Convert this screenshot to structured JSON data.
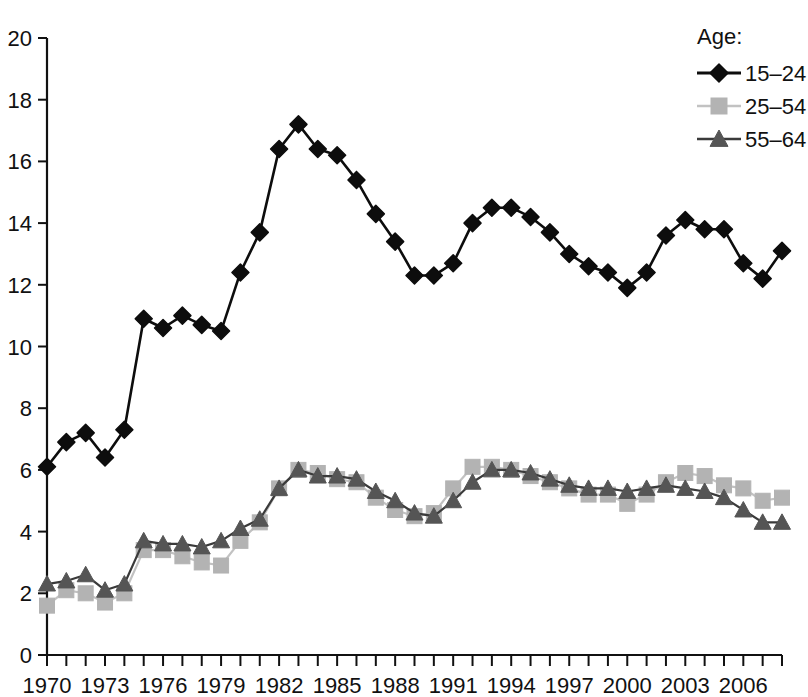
{
  "chart_data": {
    "type": "line",
    "title": "",
    "xlabel": "",
    "ylabel": "",
    "xlim": [
      1970,
      2008
    ],
    "ylim": [
      0,
      20
    ],
    "ytick_step": 2,
    "grid": false,
    "legend_position": "top-right",
    "legend_title": "Age:",
    "yticks": [
      "0",
      "2",
      "4",
      "6",
      "8",
      "10",
      "12",
      "14",
      "16",
      "18",
      "20"
    ],
    "x": [
      1970,
      1971,
      1972,
      1973,
      1974,
      1975,
      1976,
      1977,
      1978,
      1979,
      1980,
      1981,
      1982,
      1983,
      1984,
      1985,
      1986,
      1987,
      1988,
      1989,
      1990,
      1991,
      1992,
      1993,
      1994,
      1995,
      1996,
      1997,
      1998,
      1999,
      2000,
      2001,
      2002,
      2003,
      2004,
      2005,
      2006,
      2007,
      2008
    ],
    "xticklabels": [
      "1970",
      "1973",
      "1976",
      "1979",
      "1982",
      "1985",
      "1988",
      "1991",
      "1994",
      "1997",
      "2000",
      "2003",
      "2006"
    ],
    "xticklabel_years": [
      1970,
      1973,
      1976,
      1979,
      1982,
      1985,
      1988,
      1991,
      1994,
      1997,
      2000,
      2003,
      2006
    ],
    "series": [
      {
        "name": "15–24",
        "marker": "diamond",
        "color": "#0d0d0d",
        "line_color": "#0d0d0d",
        "values": [
          6.1,
          6.9,
          7.2,
          6.4,
          7.3,
          10.9,
          10.6,
          11.0,
          10.7,
          10.5,
          12.4,
          13.7,
          16.4,
          17.2,
          16.4,
          16.2,
          15.4,
          14.3,
          13.4,
          12.3,
          12.3,
          12.7,
          14.0,
          14.5,
          14.5,
          14.2,
          13.7,
          13.0,
          12.6,
          12.4,
          11.9,
          12.4,
          13.6,
          14.1,
          13.8,
          13.8,
          12.7,
          12.2,
          13.1
        ]
      },
      {
        "name": "25–54",
        "marker": "square",
        "color": "#b3b3b3",
        "line_color": "#c2c2c2",
        "values": [
          1.6,
          2.1,
          2.0,
          1.7,
          2.0,
          3.4,
          3.4,
          3.2,
          3.0,
          2.9,
          3.7,
          4.3,
          5.4,
          6.0,
          5.9,
          5.7,
          5.6,
          5.1,
          4.7,
          4.5,
          4.6,
          5.4,
          6.1,
          6.1,
          6.0,
          5.8,
          5.6,
          5.4,
          5.2,
          5.2,
          4.9,
          5.2,
          5.6,
          5.9,
          5.8,
          5.5,
          5.4,
          5.0,
          5.1
        ]
      },
      {
        "name": "55–64",
        "marker": "triangle",
        "color": "#555555",
        "line_color": "#3a3a3a",
        "values": [
          2.3,
          2.4,
          2.6,
          2.1,
          2.3,
          3.7,
          3.6,
          3.6,
          3.5,
          3.7,
          4.1,
          4.4,
          5.4,
          6.0,
          5.8,
          5.8,
          5.7,
          5.3,
          5.0,
          4.6,
          4.5,
          5.0,
          5.6,
          6.0,
          6.0,
          5.9,
          5.7,
          5.5,
          5.4,
          5.4,
          5.3,
          5.4,
          5.5,
          5.4,
          5.3,
          5.1,
          4.7,
          4.3,
          4.3
        ]
      }
    ]
  },
  "legend": {
    "title": "Age:",
    "entries": [
      {
        "label": "15–24"
      },
      {
        "label": "25–54"
      },
      {
        "label": "55–64"
      }
    ]
  }
}
